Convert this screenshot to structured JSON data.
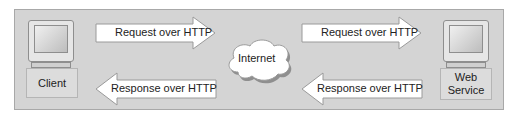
{
  "diagram": {
    "nodes": {
      "client": {
        "label": "Client"
      },
      "internet": {
        "label": "Internet"
      },
      "web_service": {
        "label_line1": "Web",
        "label_line2": "Service"
      }
    },
    "arrows": {
      "left_request": {
        "label": "Request over HTTP",
        "direction": "right"
      },
      "left_response": {
        "label": "Response over HTTP",
        "direction": "left"
      },
      "right_request": {
        "label": "Request over HTTP",
        "direction": "right"
      },
      "right_response": {
        "label": "Response over HTTP",
        "direction": "left"
      }
    },
    "colors": {
      "panel": "#d4d4d4",
      "arrow_fill": "#ffffff",
      "arrow_stroke": "#9a9a9a",
      "cloud_fill": "#ffffff"
    }
  }
}
